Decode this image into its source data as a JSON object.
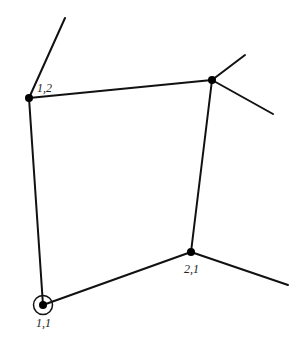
{
  "diagram": {
    "type": "graph",
    "nodes": [
      {
        "id": "n12",
        "label": "1,2",
        "x": 29,
        "y": 98,
        "label_x": 37,
        "label_y": 92
      },
      {
        "id": "ntr",
        "label": "",
        "x": 212,
        "y": 80,
        "label_x": 0,
        "label_y": 0
      },
      {
        "id": "n21",
        "label": "2,1",
        "x": 191,
        "y": 252,
        "label_x": 184,
        "label_y": 273
      },
      {
        "id": "n11",
        "label": "1,1",
        "x": 43,
        "y": 305,
        "label_x": 36,
        "label_y": 327,
        "highlighted": true
      }
    ],
    "labels": {
      "n12": "1,2",
      "n21": "2,1",
      "n11": "1,1"
    },
    "edges": [
      {
        "from": "n12",
        "to": "ntr"
      },
      {
        "from": "n12",
        "to": "n11"
      },
      {
        "from": "ntr",
        "to": "n21"
      },
      {
        "from": "n11",
        "to": "n21"
      }
    ],
    "dangling_edges": [
      {
        "from": "n12",
        "x2": 65,
        "y2": 18
      },
      {
        "from": "ntr",
        "x2": 245,
        "y2": 55
      },
      {
        "from": "ntr",
        "x2": 273,
        "y2": 114
      },
      {
        "from": "n21",
        "x2": 288,
        "y2": 285
      }
    ],
    "colors": {
      "line": "#111111",
      "node": "#000000",
      "background": "#ffffff"
    }
  }
}
